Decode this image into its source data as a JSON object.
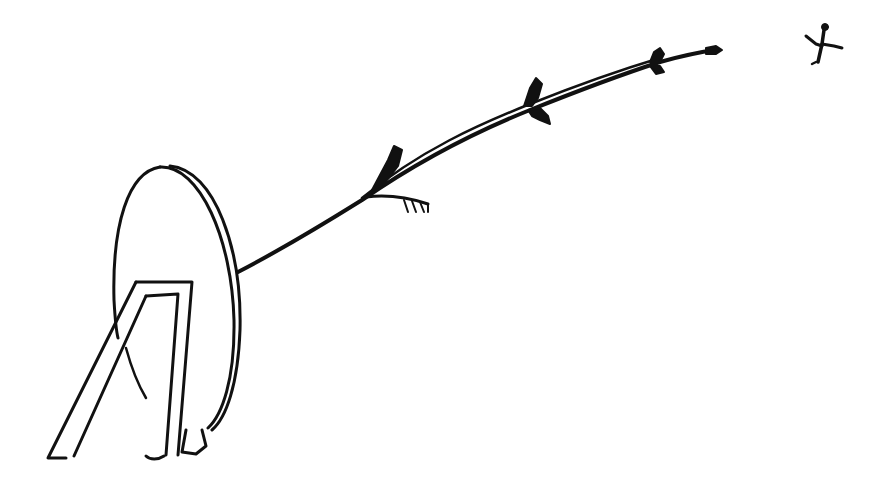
{
  "scene": {
    "description": "Hand-drawn ink sketch of an archery target on a stand with a long curved arrow trail leading from the target toward a small figure in the upper-right corner",
    "ink_color": "#111111",
    "background_color": "#ffffff",
    "elements": [
      {
        "name": "archery-target",
        "kind": "oval target disc with rim"
      },
      {
        "name": "target-stand",
        "kind": "A-frame easel legs"
      },
      {
        "name": "arrow-trail",
        "kind": "curved shaft with fletching marks"
      },
      {
        "name": "tiny-figure",
        "kind": "small leaping figure"
      }
    ]
  }
}
